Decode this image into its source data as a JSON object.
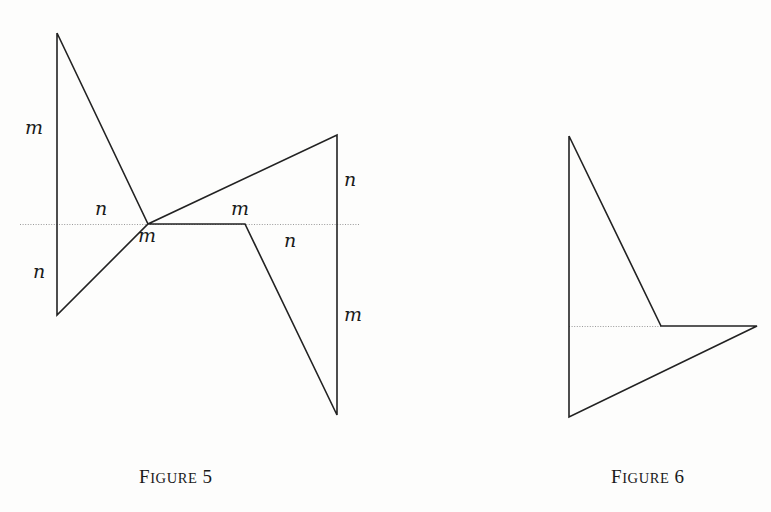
{
  "page": {
    "background_color": "#fdfdfc",
    "stroke_color": "#222222",
    "axis_color": "#9a9a9a",
    "width": 771,
    "height": 512
  },
  "figures": [
    {
      "id": "figure-5",
      "caption_first": "F",
      "caption_rest": "IGURE",
      "caption_number": "5",
      "caption_full": "Figure 5",
      "axis": {
        "x1": 20,
        "y1": 224,
        "x2": 360,
        "y2": 224
      },
      "polyline": "57,33 57,315 148,224 337,135 337,415 245,224 148,224 57,33",
      "labels": [
        {
          "text": "m",
          "x": 25,
          "y": 118,
          "name": "label-m-upper-left"
        },
        {
          "text": "n",
          "x": 33,
          "y": 262,
          "name": "label-n-lower-left"
        },
        {
          "text": "n",
          "x": 95,
          "y": 199,
          "name": "label-n-upper-mid"
        },
        {
          "text": "m",
          "x": 138,
          "y": 226,
          "name": "label-m-valley"
        },
        {
          "text": "m",
          "x": 231,
          "y": 199,
          "name": "label-m-peak"
        },
        {
          "text": "n",
          "x": 284,
          "y": 231,
          "name": "label-n-lower-mid"
        },
        {
          "text": "n",
          "x": 344,
          "y": 170,
          "name": "label-n-upper-right"
        },
        {
          "text": "m",
          "x": 344,
          "y": 305,
          "name": "label-m-lower-right"
        }
      ]
    },
    {
      "id": "figure-6",
      "caption_first": "F",
      "caption_rest": "IGURE",
      "caption_number": "6",
      "caption_full": "Figure 6",
      "axis_dotted": {
        "x1": 569,
        "y1": 326,
        "x2": 661,
        "y2": 326
      },
      "polyline": "569,136 569,417 757,326 661,326 569,136",
      "labels": []
    }
  ],
  "captions": [
    {
      "id": "caption-figure-5",
      "first": "F",
      "rest": "IGURE",
      "number": "5",
      "x": 139,
      "y": 466
    },
    {
      "id": "caption-figure-6",
      "first": "F",
      "rest": "IGURE",
      "number": "6",
      "x": 611,
      "y": 466
    }
  ]
}
